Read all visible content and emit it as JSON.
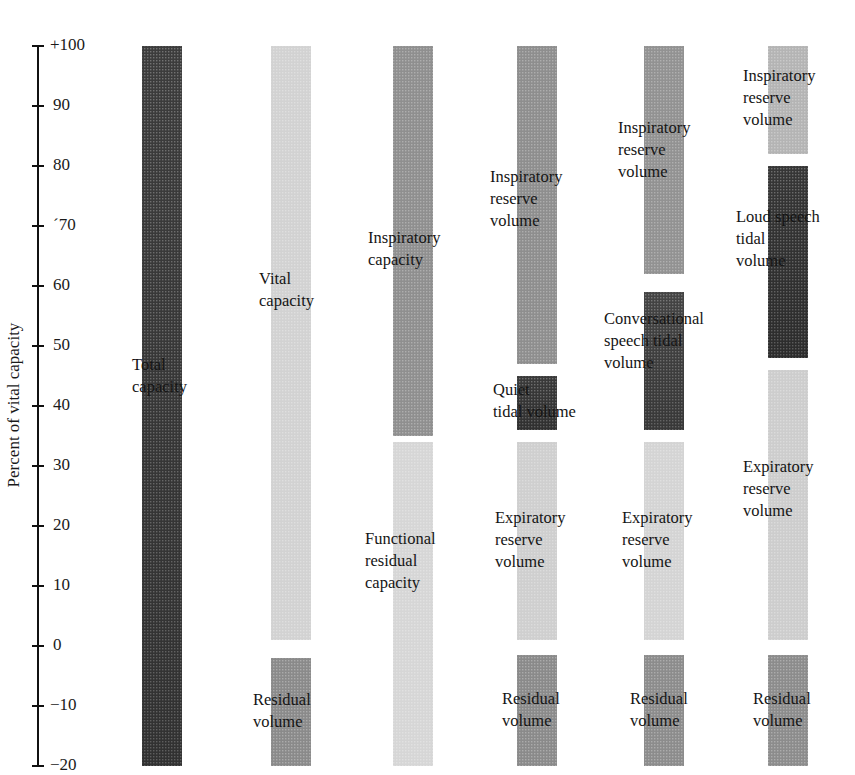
{
  "chart_data": {
    "type": "stacked-bar-diagram",
    "title": "",
    "ylabel": "Percent of vital capacity",
    "ylim": [
      -20,
      100
    ],
    "yticks": [
      100,
      90,
      80,
      70,
      60,
      50,
      40,
      30,
      20,
      10,
      0,
      -10,
      -20
    ],
    "ytick_labels": [
      "+100",
      "90",
      "80",
      "´70",
      "60",
      "50",
      "40",
      "30",
      "20",
      "10",
      "0",
      "−10",
      "−20"
    ],
    "grid": false,
    "legend": null,
    "columns": [
      {
        "name": "column-total",
        "segments": [
          {
            "label": "Total\ncapacity",
            "top": 100,
            "bottom": -20,
            "shade": "#3c3c3c"
          }
        ]
      },
      {
        "name": "column-vital",
        "segments": [
          {
            "label": "Vital\ncapacity",
            "top": 100,
            "bottom": 1,
            "shade": "#d2d2d2"
          },
          {
            "label": "Residual\nvolume",
            "top": -2,
            "bottom": -20,
            "shade": "#8a8a8a"
          }
        ]
      },
      {
        "name": "column-inspiratory",
        "segments": [
          {
            "label": "Inspiratory\ncapacity",
            "top": 100,
            "bottom": 35,
            "shade": "#8f8f8f"
          },
          {
            "label": "Functional\nresidual\ncapacity",
            "top": 34,
            "bottom": -20,
            "shade": "#d6d6d6"
          }
        ]
      },
      {
        "name": "column-quiet",
        "segments": [
          {
            "label": "Inspiratory\nreserve\nvolume",
            "top": 100,
            "bottom": 47,
            "shade": "#8e8e8e"
          },
          {
            "label": "Quiet\ntidal volume",
            "top": 45,
            "bottom": 36,
            "shade": "#3a3a3a"
          },
          {
            "label": "Expiratory\nreserve\nvolume",
            "top": 34,
            "bottom": 1,
            "shade": "#cfcfcf"
          },
          {
            "label": "Residual\nvolume",
            "top": -1.5,
            "bottom": -20,
            "shade": "#8a8a8a"
          }
        ]
      },
      {
        "name": "column-conversational",
        "segments": [
          {
            "label": "Inspiratory\nreserve\nvolume",
            "top": 100,
            "bottom": 62,
            "shade": "#929292"
          },
          {
            "label": "Conversational\nspeech tidal\nvolume",
            "top": 59,
            "bottom": 36,
            "shade": "#444444"
          },
          {
            "label": "Expiratory\nreserve\nvolume",
            "top": 34,
            "bottom": 1,
            "shade": "#d4d4d4"
          },
          {
            "label": "Residual\nvolume",
            "top": -1.5,
            "bottom": -20,
            "shade": "#8c8c8c"
          }
        ]
      },
      {
        "name": "column-loud",
        "segments": [
          {
            "label": "Inspiratory\nreserve\nvolume",
            "top": 100,
            "bottom": 82,
            "shade": "#b4b4b4"
          },
          {
            "label": "Loud speech\ntidal\nvolume",
            "top": 80,
            "bottom": 48,
            "shade": "#363636"
          },
          {
            "label": "Expiratory\nreserve\nvolume",
            "top": 46,
            "bottom": 1,
            "shade": "#cdcdcd"
          },
          {
            "label": "Residual\nvolume",
            "top": -1.5,
            "bottom": -20,
            "shade": "#8c8c8c"
          }
        ]
      }
    ]
  },
  "axis": {
    "title": "Percent of vital capacity",
    "ticks": [
      {
        "value": 100,
        "label": "+100"
      },
      {
        "value": 90,
        "label": "90"
      },
      {
        "value": 80,
        "label": "80"
      },
      {
        "value": 70,
        "label": "´70"
      },
      {
        "value": 60,
        "label": "60"
      },
      {
        "value": 50,
        "label": "50"
      },
      {
        "value": 40,
        "label": "40"
      },
      {
        "value": 30,
        "label": "30"
      },
      {
        "value": 20,
        "label": "20"
      },
      {
        "value": 10,
        "label": "10"
      },
      {
        "value": 0,
        "label": "0"
      },
      {
        "value": -10,
        "label": "−10"
      },
      {
        "value": -20,
        "label": "−20"
      }
    ]
  },
  "labels": {
    "total": "Total\ncapacity",
    "vital": "Vital\ncapacity",
    "residual_2": "Residual\nvolume",
    "inspiratory_capacity": "Inspiratory\ncapacity",
    "frc": "Functional\nresidual\ncapacity",
    "irv_4": "Inspiratory\nreserve\nvolume",
    "quiet": "Quiet\ntidal volume",
    "erv_4": "Expiratory\nreserve\nvolume",
    "residual_4": "Residual\nvolume",
    "irv_5": "Inspiratory\nreserve\nvolume",
    "conv": "Conversational\nspeech tidal\nvolume",
    "erv_5": "Expiratory\nreserve\nvolume",
    "residual_5": "Residual\nvolume",
    "irv_6": "Inspiratory\nreserve\nvolume",
    "loud": "Loud speech\ntidal\nvolume",
    "erv_6": "Expiratory\nreserve\nvolume",
    "residual_6": "Residual\nvolume"
  }
}
